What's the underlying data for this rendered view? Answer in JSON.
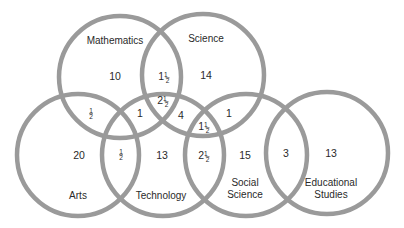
{
  "diagram": {
    "type": "venn",
    "circles": [
      {
        "id": "mathematics",
        "name": "Mathematics",
        "cx": 120,
        "cy": 77,
        "r": 61,
        "label_lines": [
          "Mathematics"
        ],
        "label_x": 115,
        "label_y": [
          44
        ]
      },
      {
        "id": "science",
        "name": "Science",
        "cx": 203,
        "cy": 75,
        "r": 61,
        "label_lines": [
          "Science"
        ],
        "label_x": 206,
        "label_y": [
          42
        ]
      },
      {
        "id": "arts",
        "name": "Arts",
        "cx": 78,
        "cy": 155,
        "r": 61,
        "label_lines": [
          "Arts"
        ],
        "label_x": 78,
        "label_y": [
          199
        ]
      },
      {
        "id": "technology",
        "name": "Technology",
        "cx": 163,
        "cy": 155,
        "r": 61,
        "label_lines": [
          "Technology"
        ],
        "label_x": 161,
        "label_y": [
          199
        ]
      },
      {
        "id": "social_science",
        "name": "Social Science",
        "cx": 246,
        "cy": 155,
        "r": 61,
        "label_lines": [
          "Social",
          "Science"
        ],
        "label_x": 245,
        "label_y": [
          186,
          198
        ]
      },
      {
        "id": "educational_studies",
        "name": "Educational Studies",
        "cx": 327,
        "cy": 153,
        "r": 61,
        "label_lines": [
          "Educational",
          "Studies"
        ],
        "label_x": 331,
        "label_y": [
          186,
          198
        ]
      }
    ],
    "regions": [
      {
        "id": "math-only",
        "whole": "10",
        "frac": "",
        "x": 115,
        "y": 80
      },
      {
        "id": "math-science",
        "whole": "1",
        "frac": "1/2",
        "x": 163,
        "y": 80
      },
      {
        "id": "science-only",
        "whole": "14",
        "frac": "",
        "x": 206,
        "y": 79
      },
      {
        "id": "math-science-tech",
        "whole": "2",
        "frac": "1/2",
        "x": 162,
        "y": 104
      },
      {
        "id": "math-arts",
        "whole": "",
        "frac": "1/2",
        "x": 91,
        "y": 116
      },
      {
        "id": "math-tech",
        "whole": "1",
        "frac": "",
        "x": 140,
        "y": 117
      },
      {
        "id": "science-tech",
        "whole": "4",
        "frac": "",
        "x": 181,
        "y": 119
      },
      {
        "id": "science-social",
        "whole": "1",
        "frac": "",
        "x": 229,
        "y": 117
      },
      {
        "id": "science-tech-social",
        "whole": "1",
        "frac": "1/2",
        "x": 203,
        "y": 130
      },
      {
        "id": "arts-only",
        "whole": "20",
        "frac": "",
        "x": 79,
        "y": 159
      },
      {
        "id": "arts-tech",
        "whole": "",
        "frac": "1/2",
        "x": 121,
        "y": 157
      },
      {
        "id": "tech-only",
        "whole": "13",
        "frac": "",
        "x": 162,
        "y": 159
      },
      {
        "id": "tech-social",
        "whole": "2",
        "frac": "1/2",
        "x": 203,
        "y": 159
      },
      {
        "id": "social-only",
        "whole": "15",
        "frac": "",
        "x": 245,
        "y": 159
      },
      {
        "id": "social-edu",
        "whole": "3",
        "frac": "",
        "x": 286,
        "y": 157
      },
      {
        "id": "edu-only",
        "whole": "13",
        "frac": "",
        "x": 331,
        "y": 157
      }
    ],
    "colors": {
      "stroke": "#9a9a9a",
      "text": "#2a2a2a",
      "background": "#ffffff"
    }
  }
}
